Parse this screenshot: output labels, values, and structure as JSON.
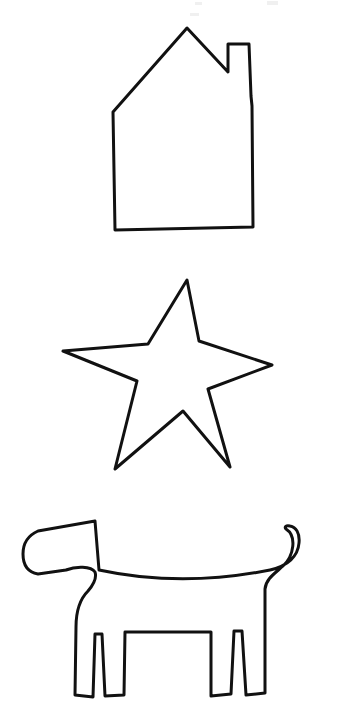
{
  "page": {
    "background_color": "#ffffff",
    "ink_color": "#111111",
    "width": 341,
    "height": 715
  },
  "figures": [
    {
      "id": "house",
      "label": "house",
      "order": 1,
      "stroke_width": 3,
      "bounds": {
        "x": 110,
        "y": 26,
        "width": 145,
        "height": 204
      },
      "parts": [
        "roof",
        "chimney",
        "left-wall",
        "right-wall",
        "base"
      ],
      "path": "M 113 112 L 187 28 L 228 72 L 228 44 L 249 44 L 251 96 L 252 106 L 253 227 L 115 230 L 113 112 Z"
    },
    {
      "id": "star",
      "label": "five-pointed star",
      "order": 2,
      "stroke_width": 3,
      "points": 5,
      "bounds": {
        "x": 62,
        "y": 279,
        "width": 212,
        "height": 192
      },
      "outer_vertices": [
        {
          "name": "top",
          "x": 187,
          "y": 280
        },
        {
          "name": "right",
          "x": 272,
          "y": 365
        },
        {
          "name": "bottom-right",
          "x": 230,
          "y": 467
        },
        {
          "name": "bottom-left",
          "x": 115,
          "y": 469
        },
        {
          "name": "left",
          "x": 63,
          "y": 351
        }
      ],
      "path": "M 187 280 L 199 341 L 272 365 L 208 389 L 230 467 L 183 411 L 115 469 L 137 381 L 63 351 L 148 344 Z"
    },
    {
      "id": "dog",
      "label": "dog",
      "order": 3,
      "stroke_width": 3,
      "bounds": {
        "x": 22,
        "y": 518,
        "width": 298,
        "height": 180
      },
      "parts": [
        "head",
        "ear",
        "snout",
        "body",
        "tail",
        "front-legs",
        "hind-legs"
      ],
      "path": "M 95 521 L 99 570 C 150 581 210 582 270 570 C 288 566 298 556 299 543 C 300 533 296 527 290 526 C 286 525 284 527 286 529 C 297 536 294 556 283 566 C 274 574 266 579 265 589 L 265 626 L 265 693 L 246 695 L 242 631 L 234 631 L 231 694 L 211 696 L 211 632 L 125 632 L 124 695 L 105 696 L 102 634 L 95 634 L 93 697 L 75 695 L 76 627 C 76 608 82 597 88 591 C 94 584 97 578 95 572 C 91 566 76 566 66 570 L 38 574 C 27 572 23 564 23 554 C 23 543 29 535 38 531 L 95 521 Z"
    }
  ]
}
